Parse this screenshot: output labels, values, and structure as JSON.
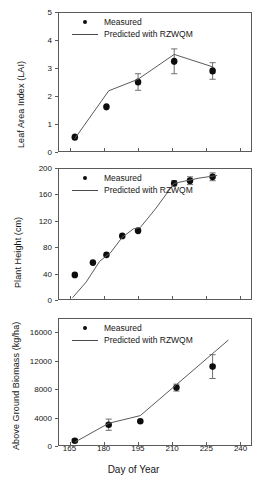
{
  "figure": {
    "xlabel": "Day of Year",
    "legend": {
      "measured": "Measured",
      "predicted": "Predicted with RZWQM"
    }
  },
  "chart_data": [
    {
      "type": "scatter",
      "panel": "top",
      "title": "",
      "xlabel": "Day of Year",
      "ylabel": "Leaf Area Index (LAI)",
      "xlim": [
        160,
        245
      ],
      "ylim": [
        0,
        5
      ],
      "xticks": [
        165,
        180,
        195,
        210,
        225,
        240
      ],
      "yticks": [
        0,
        1,
        2,
        3,
        4,
        5
      ],
      "grid": false,
      "legend_position": "top-left",
      "series": [
        {
          "name": "Measured",
          "style": "points-with-error-bars",
          "x": [
            167,
            181,
            195,
            211,
            228
          ],
          "values": [
            0.5,
            1.6,
            2.5,
            3.25,
            2.9
          ],
          "yerr": [
            0.0,
            0.0,
            0.3,
            0.45,
            0.3
          ]
        },
        {
          "name": "Predicted with RZWQM",
          "style": "line",
          "x": [
            167,
            182,
            195,
            211,
            228
          ],
          "values": [
            0.45,
            2.18,
            2.6,
            3.5,
            3.05
          ]
        }
      ]
    },
    {
      "type": "scatter",
      "panel": "middle",
      "title": "",
      "xlabel": "Day of Year",
      "ylabel": "Plant Height (cm)",
      "xlim": [
        160,
        245
      ],
      "ylim": [
        0,
        200
      ],
      "xticks": [
        165,
        180,
        195,
        210,
        225,
        240
      ],
      "yticks": [
        0,
        40,
        80,
        120,
        160,
        200
      ],
      "grid": false,
      "legend_position": "top-left",
      "series": [
        {
          "name": "Measured",
          "style": "points-with-error-bars",
          "x": [
            167,
            175,
            181,
            188,
            195,
            211,
            218,
            228
          ],
          "values": [
            37,
            56,
            68,
            97,
            105,
            178,
            182,
            188
          ],
          "yerr": [
            0,
            0,
            0,
            0,
            0,
            4,
            6,
            6
          ]
        },
        {
          "name": "Predicted with RZWQM",
          "style": "line",
          "x": [
            166,
            172,
            178,
            183,
            188,
            193,
            196,
            203,
            211,
            222,
            230
          ],
          "values": [
            2,
            26,
            58,
            72,
            95,
            108,
            110,
            140,
            178,
            186,
            190
          ]
        }
      ]
    },
    {
      "type": "scatter",
      "panel": "bottom",
      "title": "",
      "xlabel": "Day of Year",
      "ylabel": "Above Ground Biomass (kg/ha)",
      "xlim": [
        160,
        245
      ],
      "ylim": [
        0,
        18000
      ],
      "xticks": [
        165,
        180,
        195,
        210,
        225,
        240
      ],
      "yticks": [
        0,
        4000,
        8000,
        12000,
        16000
      ],
      "grid": false,
      "legend_position": "top-left",
      "series": [
        {
          "name": "Measured",
          "style": "points-with-error-bars",
          "x": [
            167,
            182,
            196,
            212,
            228
          ],
          "values": [
            600,
            2900,
            3400,
            8200,
            11200
          ],
          "yerr": [
            200,
            800,
            0,
            500,
            1700
          ]
        },
        {
          "name": "Predicted with RZWQM",
          "style": "line",
          "x": [
            167,
            182,
            196,
            235
          ],
          "values": [
            400,
            3100,
            4200,
            15000
          ]
        }
      ]
    }
  ]
}
